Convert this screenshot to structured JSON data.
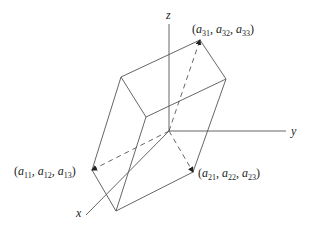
{
  "diagram": {
    "type": "parallelepiped-with-axes",
    "colors": {
      "line": "#555555",
      "text": "#222222",
      "background": "#ffffff"
    },
    "axes": [
      {
        "name": "x",
        "label": "x",
        "from": [
          169,
          131
        ],
        "to": [
          86,
          215
        ],
        "label_pos": [
          76,
          217
        ]
      },
      {
        "name": "y",
        "label": "y",
        "from": [
          169,
          131
        ],
        "to": [
          286,
          131
        ],
        "label_pos": [
          291,
          135
        ]
      },
      {
        "name": "z",
        "label": "z",
        "from": [
          169,
          131
        ],
        "to": [
          169,
          24
        ],
        "label_pos": [
          166,
          19
        ]
      }
    ],
    "vectors": [
      {
        "name": "row-1",
        "label": "(a11, a12, a13)",
        "parts": [
          [
            "a",
            "11"
          ],
          [
            "a",
            "12"
          ],
          [
            "a",
            "13"
          ]
        ],
        "to": [
          92,
          170
        ],
        "label_pos": [
          14,
          175
        ]
      },
      {
        "name": "row-2",
        "label": "(a21, a22, a23)",
        "parts": [
          [
            "a",
            "21"
          ],
          [
            "a",
            "22"
          ],
          [
            "a",
            "23"
          ]
        ],
        "to": [
          193,
          172
        ],
        "label_pos": [
          198,
          177
        ]
      },
      {
        "name": "row-3",
        "label": "(a31, a32, a33)",
        "parts": [
          [
            "a",
            "31"
          ],
          [
            "a",
            "32"
          ],
          [
            "a",
            "33"
          ]
        ],
        "to": [
          200,
          40
        ],
        "label_pos": [
          192,
          33
        ]
      }
    ],
    "edges": [
      [
        [
          200,
          40
        ],
        [
          121,
          77
        ]
      ],
      [
        [
          200,
          40
        ],
        [
          226,
          79
        ]
      ],
      [
        [
          121,
          77
        ],
        [
          146,
          117
        ]
      ],
      [
        [
          146,
          117
        ],
        [
          226,
          79
        ]
      ],
      [
        [
          121,
          77
        ],
        [
          92,
          170
        ]
      ],
      [
        [
          146,
          117
        ],
        [
          116,
          211
        ]
      ],
      [
        [
          92,
          170
        ],
        [
          116,
          211
        ]
      ],
      [
        [
          116,
          211
        ],
        [
          193,
          172
        ]
      ],
      [
        [
          226,
          79
        ],
        [
          193,
          172
        ]
      ]
    ]
  }
}
